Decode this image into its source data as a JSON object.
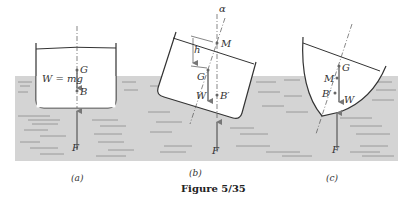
{
  "figure": {
    "caption": "Figure 5/35",
    "colors": {
      "water": "#d4d4d4",
      "water_lines": "#8a8a8a",
      "hull": "#333333",
      "arrow": "#777777"
    }
  },
  "panels": [
    {
      "id": "a",
      "caption": "(a)",
      "labels": {
        "weight": "W = mg",
        "G": "G",
        "B": "B",
        "F": "F"
      }
    },
    {
      "id": "b",
      "caption": "(b)",
      "labels": {
        "alpha": "α",
        "M": "M",
        "h": "h",
        "G": "G",
        "W": "W",
        "B": "B′",
        "F": "F"
      }
    },
    {
      "id": "c",
      "caption": "(c)",
      "labels": {
        "G": "G",
        "M": "M",
        "B": "B′",
        "W": "W",
        "F": "F"
      }
    }
  ]
}
